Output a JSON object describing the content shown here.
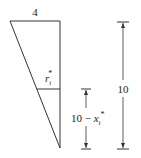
{
  "diagram": {
    "top_width_label": "4",
    "radius_label": "r",
    "radius_subscript": "i",
    "radius_superscript": "*",
    "partial_height_prefix": "10 − ",
    "partial_height_var": "x",
    "partial_height_subscript": "i",
    "partial_height_superscript": "*",
    "total_height_label": "10",
    "colors": {
      "line": "#333333",
      "text": "#222222",
      "background": "#ffffff"
    }
  }
}
